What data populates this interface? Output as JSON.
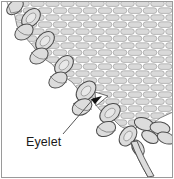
{
  "figure": {
    "title": "Eyelet",
    "type": "knitting-stitch-diagram",
    "width": 174,
    "height": 179,
    "background_color": "#ffffff",
    "frame": {
      "border_color": "#9a9a9a",
      "border_width": 1
    },
    "colors": {
      "outline": "#4a4a4a",
      "stitch_fill": "#d9d9d9",
      "stitch_fill_light": "#e6e6e6",
      "mortar": "#ffffff",
      "label_text": "#1a1a1a",
      "leader_line": "#555555",
      "arrow": "#111111"
    },
    "fabric": {
      "name": "stockinette-brick-texture",
      "description": "rows of elongated brick-like knit stitches filling the upper-right region",
      "brick_width": 15,
      "brick_height": 7,
      "row_offset": 7.5,
      "rows": 17,
      "columns": 12
    },
    "edge_chain": {
      "name": "diagonal-selvedge-loop-chain",
      "description": "chain of oval yarn loops running diagonally from upper-left to lower-right",
      "loops": [
        {
          "cx": 14,
          "cy": 6,
          "rx": 9,
          "ry": 6,
          "rot": -38
        },
        {
          "cx": 30,
          "cy": 17,
          "rx": 11,
          "ry": 7,
          "rot": -42
        },
        {
          "cx": 26,
          "cy": 33,
          "rx": 10,
          "ry": 7,
          "rot": -38
        },
        {
          "cx": 46,
          "cy": 42,
          "rx": 11,
          "ry": 7,
          "rot": -44
        },
        {
          "cx": 42,
          "cy": 57,
          "rx": 10,
          "ry": 7,
          "rot": -38
        },
        {
          "cx": 66,
          "cy": 66,
          "rx": 11,
          "ry": 7,
          "rot": -44
        },
        {
          "cx": 62,
          "cy": 81,
          "rx": 10,
          "ry": 7,
          "rot": -38
        },
        {
          "cx": 88,
          "cy": 90,
          "rx": 11,
          "ry": 7,
          "rot": -44
        },
        {
          "cx": 84,
          "cy": 105,
          "rx": 10,
          "ry": 7,
          "rot": -38
        },
        {
          "cx": 110,
          "cy": 114,
          "rx": 11,
          "ry": 7,
          "rot": -44
        },
        {
          "cx": 108,
          "cy": 130,
          "rx": 10,
          "ry": 7,
          "rot": -38
        },
        {
          "cx": 130,
          "cy": 138,
          "rx": 11,
          "ry": 7,
          "rot": -44
        }
      ]
    },
    "eyelet": {
      "name": "eyelet-hole",
      "cx": 101,
      "cy": 99,
      "description": "triangular white opening in the fabric where the arrow points"
    },
    "callout": {
      "label": "Eyelet",
      "label_x": 26,
      "label_y": 141,
      "leader_from": {
        "x": 63,
        "y": 134
      },
      "leader_to": {
        "x": 95,
        "y": 97
      },
      "arrow_tip": {
        "x": 101,
        "y": 97
      },
      "arrow_angle": -22
    },
    "yarn_tail": {
      "name": "yarn-tail-strand",
      "description": "loose strand of yarn trailing down to the bottom-right edge",
      "from": {
        "x": 132,
        "y": 143
      },
      "to": {
        "x": 149,
        "y": 176
      }
    }
  }
}
